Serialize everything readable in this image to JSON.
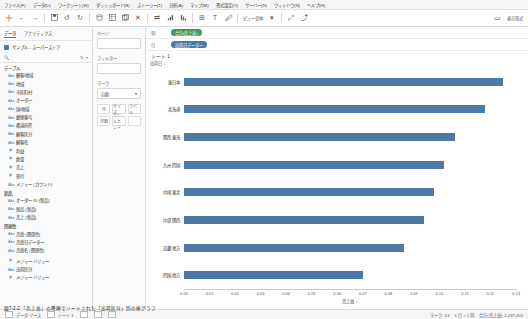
{
  "menubar": {
    "items": [
      "ファイル(F)",
      "データ(D)",
      "ワークシート(W)",
      "ダッシュボード(B)",
      "ストーリー(T)",
      "分析(A)",
      "マップ(M)",
      "書式設定(O)",
      "サーバー(S)",
      "ウィンドウ(N)",
      "ヘルプ(H)"
    ]
  },
  "toolbar": {
    "icons": [
      "tableau-logo",
      "back-arrow",
      "forward-arrow",
      "save-icon",
      "undo-icon",
      "new-data-source-icon",
      "new-worksheet-icon",
      "duplicate-icon",
      "clear-icon",
      "swap-axes-icon",
      "sort-asc-icon",
      "sort-desc-icon",
      "highlight-icon",
      "group-icon",
      "labels-icon",
      "fit-dropdown",
      "fixed-axis-icon",
      "presentation-icon",
      "share-icon"
    ],
    "fit_label": "ビュー全体",
    "presentation_label": "表示形式"
  },
  "left_pane": {
    "tabs": [
      "データ",
      "アナリティクス"
    ],
    "active_tab": "データ",
    "search_placeholder": "ページ",
    "data_source": "サンプル - スーパーストア",
    "sections": [
      {
        "label": "テーブル",
        "items": [
          {
            "icon": "abc",
            "label": "顧客/地域"
          },
          {
            "icon": "abc",
            "label": "地域"
          },
          {
            "icon": "abc",
            "label": "市区町村"
          },
          {
            "icon": "abc",
            "label": "オーダー"
          },
          {
            "icon": "abc",
            "label": "国/地域"
          },
          {
            "icon": "abc",
            "label": "郵便番号"
          },
          {
            "icon": "abc",
            "label": "都道府県"
          },
          {
            "icon": "abc",
            "label": "顧客区分"
          },
          {
            "icon": "abc",
            "label": "顧客名"
          },
          {
            "icon": "hash",
            "label": "利益"
          },
          {
            "icon": "hash",
            "label": "数量"
          },
          {
            "icon": "hash",
            "label": "売上"
          },
          {
            "icon": "hash",
            "label": "割引"
          },
          {
            "icon": "abc",
            "label": "メジャー (カウント)"
          }
        ]
      },
      {
        "label": "製品",
        "items": [
          {
            "icon": "abc",
            "label": "オーダー ID (製品)"
          },
          {
            "icon": "abc",
            "label": "製品 (製品)"
          },
          {
            "icon": "abc",
            "label": "売上 (製品)"
          }
        ]
      },
      {
        "label": "関係性",
        "items": [
          {
            "icon": "abc",
            "label": "売掛 (関係性)"
          },
          {
            "icon": "abc",
            "label": "売掛日データー"
          },
          {
            "icon": "abc",
            "label": "売掛名 (関係性)"
          }
        ]
      },
      {
        "label": "",
        "items": [
          {
            "icon": "hash",
            "label": "メジャー バリュー"
          },
          {
            "icon": "abc",
            "label": "出荷区分"
          },
          {
            "icon": "hash",
            "label": "メジャー バリュー"
          }
        ]
      }
    ]
  },
  "shelf_pane": {
    "pages_label": "ページ",
    "filters_label": "フィルター",
    "marks_label": "マーク",
    "marks_type": "自動",
    "marks_buttons": [
      "色",
      "サイズ",
      "ラベル",
      "詳細",
      "ツールヒント"
    ]
  },
  "shelves": {
    "columns_label": "列",
    "rows_label": "行",
    "columns_pills": [
      {
        "text": "合計(売上高)",
        "color": "green"
      }
    ],
    "rows_pills": [
      {
        "text": "出荷日データー",
        "color": "blue"
      }
    ]
  },
  "sheet": {
    "title": "シート 1",
    "field_header": "出荷日 ↓"
  },
  "status": {
    "marks_count": "マーク: 13",
    "rows_cols": "1 行 × 1 列",
    "sum_label": "合計(売上高): 2,297,201",
    "left_items": [
      "データ ソース",
      "シート 1"
    ]
  },
  "caption": "図7-2-2 「売上高」の降順でソートされた「出荷区分」別の棒グラフ",
  "colors": {
    "bar": "#4e79a7",
    "green_pill": "#3f9c55",
    "blue_pill": "#4e79a7"
  },
  "chart_data": {
    "type": "bar",
    "title": "シート 1",
    "xlabel": "売上高 ↓",
    "ylabel": "出荷日 ↓",
    "categories": [
      "東日本",
      "北海道",
      "関西 東海",
      "九州 四国",
      "中国 東北",
      "中部 関西",
      "近畿 地方",
      "四国 地方"
    ],
    "values": [
      0.125,
      0.118,
      0.106,
      0.102,
      0.098,
      0.094,
      0.086,
      0.07
    ],
    "ticks": [
      "0.00",
      "0.01",
      "0.02",
      "0.03",
      "0.04",
      "0.05",
      "0.06",
      "0.07",
      "0.08",
      "0.09",
      "0.10",
      "0.11",
      "0.12",
      "0.13"
    ],
    "xlim": [
      0,
      0.13
    ],
    "grid": false,
    "legend": "none"
  }
}
